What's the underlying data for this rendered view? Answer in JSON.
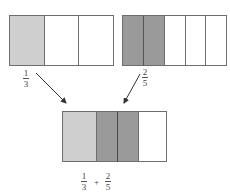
{
  "diagram": {
    "type": "fraction-addition-bar-model",
    "colors": {
      "light": "#cfcfcf",
      "dark": "#9a9a9a",
      "empty": "#ffffff",
      "stroke": "#6e6e6e"
    },
    "boxes": [
      {
        "id": "one-third",
        "parts": 3,
        "shaded": 1,
        "shade": "light"
      },
      {
        "id": "two-fifths",
        "parts": 5,
        "shaded": 2,
        "shade": "dark"
      },
      {
        "id": "sum",
        "segments": [
          "light 1/3",
          "dark 1/5",
          "dark 1/5",
          "empty"
        ]
      }
    ],
    "labels": {
      "left": {
        "numerator": "1",
        "denominator": "3"
      },
      "right": {
        "numerator": "2",
        "denominator": "5"
      },
      "sum": {
        "a": {
          "numerator": "1",
          "denominator": "3"
        },
        "operator": "+",
        "b": {
          "numerator": "2",
          "denominator": "5"
        }
      }
    },
    "arrows": [
      {
        "from": "one-third",
        "to": "sum"
      },
      {
        "from": "two-fifths",
        "to": "sum"
      }
    ]
  }
}
